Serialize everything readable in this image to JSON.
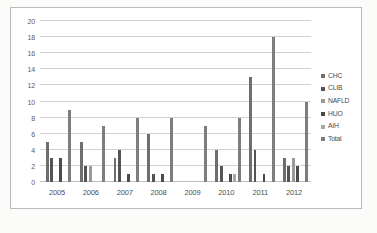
{
  "chart_data": {
    "type": "bar",
    "title": "",
    "xlabel": "",
    "ylabel": "",
    "ylim": [
      0,
      20
    ],
    "yticks": [
      0,
      2,
      4,
      6,
      8,
      10,
      12,
      14,
      16,
      18,
      20
    ],
    "grid": true,
    "legend_position": "right",
    "categories": [
      "2005",
      "2006",
      "2007",
      "2008",
      "2009",
      "2010",
      "2011",
      "2012"
    ],
    "series": [
      {
        "name": "CHC",
        "color": "#6e6e6e",
        "values": [
          5,
          5,
          3,
          6,
          0,
          4,
          13,
          3
        ]
      },
      {
        "name": "CLIB",
        "color": "#545454",
        "values": [
          3,
          2,
          4,
          1,
          0,
          2,
          4,
          2
        ]
      },
      {
        "name": "NAFLD",
        "color": "#9a9a9a",
        "values": [
          0,
          2,
          0,
          0,
          0,
          0,
          0,
          3
        ]
      },
      {
        "name": "HUO",
        "color": "#4a4a4a",
        "values": [
          3,
          0,
          1,
          1,
          0,
          1,
          1,
          2
        ]
      },
      {
        "name": "AIH",
        "color": "#a8a8a8",
        "values": [
          0,
          0,
          0,
          0,
          0,
          1,
          0,
          0
        ]
      },
      {
        "name": "Total",
        "color": "#7d7d7d",
        "values": [
          9,
          7,
          8,
          8,
          7,
          8,
          18,
          10
        ]
      }
    ]
  },
  "legend": {
    "items": [
      {
        "label": "CHC"
      },
      {
        "label": "CLIB"
      },
      {
        "label": "NAFLD"
      },
      {
        "label": "HUO"
      },
      {
        "label": "AIH"
      },
      {
        "label": "Total"
      }
    ]
  }
}
